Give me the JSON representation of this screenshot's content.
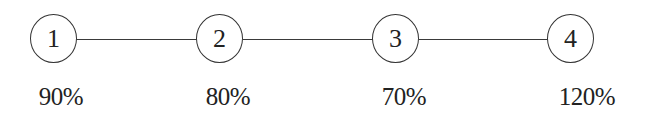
{
  "diagram": {
    "type": "linear-node-chain",
    "nodes": [
      {
        "id": "1",
        "label": "1",
        "percent": "90%",
        "cx": 53
      },
      {
        "id": "2",
        "label": "2",
        "percent": "80%",
        "cx": 220
      },
      {
        "id": "3",
        "label": "3",
        "percent": "70%",
        "cx": 396
      },
      {
        "id": "4",
        "label": "4",
        "percent": "120%",
        "cx": 571
      }
    ],
    "edges": [
      {
        "from": "1",
        "to": "2"
      },
      {
        "from": "2",
        "to": "3"
      },
      {
        "from": "3",
        "to": "4"
      }
    ],
    "colors": {
      "stroke": "#333333",
      "text": "#222222",
      "background": "#ffffff"
    }
  }
}
